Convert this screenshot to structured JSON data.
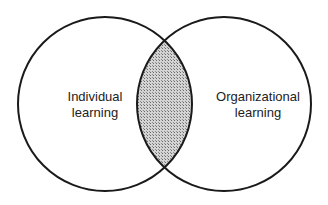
{
  "diagram": {
    "type": "venn",
    "circles": [
      {
        "id": "left",
        "line1": "Individual",
        "line2": "learning"
      },
      {
        "id": "right",
        "line1": "Organizational",
        "line2": "learning"
      }
    ],
    "intersection": {
      "fill": "hatched-gray"
    },
    "colors": {
      "stroke": "#1a1a1a",
      "hatch_dark": "#6e6e6e",
      "hatch_light": "#d8d8d8",
      "background": "#ffffff"
    }
  }
}
